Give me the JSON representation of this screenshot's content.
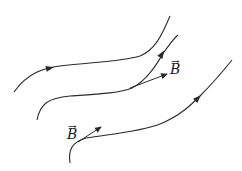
{
  "diagram": {
    "type": "magnetic-field-lines",
    "line_color": "#2a2a2a",
    "field_lines": [
      {
        "id": "line-1",
        "path": "M14,92 C28,72 45,68 60,66 C90,62 120,62 140,56 C155,50 162,35 170,16",
        "arrow_at": [
          50,
          68
        ],
        "arrow_angle": -12
      },
      {
        "id": "line-2",
        "path": "M37,120 C40,104 48,98 70,96 C100,94 120,93 132,88 C148,80 158,62 164,52 C170,44 174,38 178,35",
        "arrow_at": [
          162,
          54
        ],
        "arrow_angle": -58
      },
      {
        "id": "line-3",
        "path": "M70,163 C68,150 72,142 86,138 C110,134 140,132 160,124 C180,116 192,104 200,96 C214,82 224,70 232,60",
        "arrow_at": [
          198,
          98
        ],
        "arrow_angle": -45
      }
    ],
    "vectors": [
      {
        "id": "B-vector-1",
        "x1": 130,
        "y1": 88,
        "x2": 167,
        "y2": 74,
        "label": "B",
        "label_x": 170,
        "label_y": 62
      },
      {
        "id": "B-vector-2",
        "x1": 78,
        "y1": 142,
        "x2": 101,
        "y2": 127,
        "label": "B",
        "label_x": 67,
        "label_y": 127
      }
    ],
    "vector_accent": "→"
  }
}
